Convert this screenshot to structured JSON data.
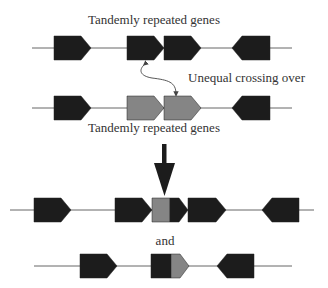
{
  "title_top": "Tandemly repeated genes",
  "crossover_label": "Unequal crossing over",
  "title_middle": "Tandemly repeated genes",
  "and_label": "and",
  "colors": {
    "gene_dark": "#1c1c1c",
    "gene_gray": "#858585",
    "line": "#666666",
    "background": "#ffffff"
  },
  "rows": [
    {
      "name": "chromosome-1",
      "line": {
        "x1": 32,
        "x2": 292,
        "y": 48
      },
      "genes": [
        {
          "x": 54,
          "w": 37,
          "dir": "right",
          "color": "dark"
        },
        {
          "x": 127,
          "w": 37,
          "dir": "right",
          "color": "dark"
        },
        {
          "x": 164,
          "w": 37,
          "dir": "right",
          "color": "dark"
        },
        {
          "x": 232,
          "w": 38,
          "dir": "left",
          "color": "dark"
        }
      ]
    },
    {
      "name": "chromosome-2",
      "line": {
        "x1": 32,
        "x2": 292,
        "y": 108
      },
      "genes": [
        {
          "x": 54,
          "w": 37,
          "dir": "right",
          "color": "dark"
        },
        {
          "x": 127,
          "w": 37,
          "dir": "right",
          "color": "gray"
        },
        {
          "x": 164,
          "w": 37,
          "dir": "right",
          "color": "gray"
        },
        {
          "x": 232,
          "w": 38,
          "dir": "left",
          "color": "dark"
        }
      ]
    },
    {
      "name": "product-duplication",
      "line": {
        "x1": 10,
        "x2": 314,
        "y": 210
      },
      "genes": [
        {
          "x": 34,
          "w": 37,
          "dir": "right",
          "color": "dark"
        },
        {
          "x": 115,
          "w": 37,
          "dir": "right",
          "color": "dark"
        },
        {
          "x": 152,
          "w": 18,
          "dir": "rect",
          "color": "gray"
        },
        {
          "x": 170,
          "w": 18,
          "dir": "right",
          "color": "dark"
        },
        {
          "x": 188,
          "w": 38,
          "dir": "right",
          "color": "dark"
        },
        {
          "x": 262,
          "w": 37,
          "dir": "left",
          "color": "dark"
        }
      ]
    },
    {
      "name": "product-deletion",
      "line": {
        "x1": 34,
        "x2": 292,
        "y": 266
      },
      "genes": [
        {
          "x": 80,
          "w": 37,
          "dir": "right",
          "color": "dark"
        },
        {
          "x": 151,
          "w": 20,
          "dir": "rect",
          "color": "dark"
        },
        {
          "x": 171,
          "w": 18,
          "dir": "right",
          "color": "gray"
        },
        {
          "x": 217,
          "w": 37,
          "dir": "left",
          "color": "dark"
        }
      ]
    }
  ]
}
